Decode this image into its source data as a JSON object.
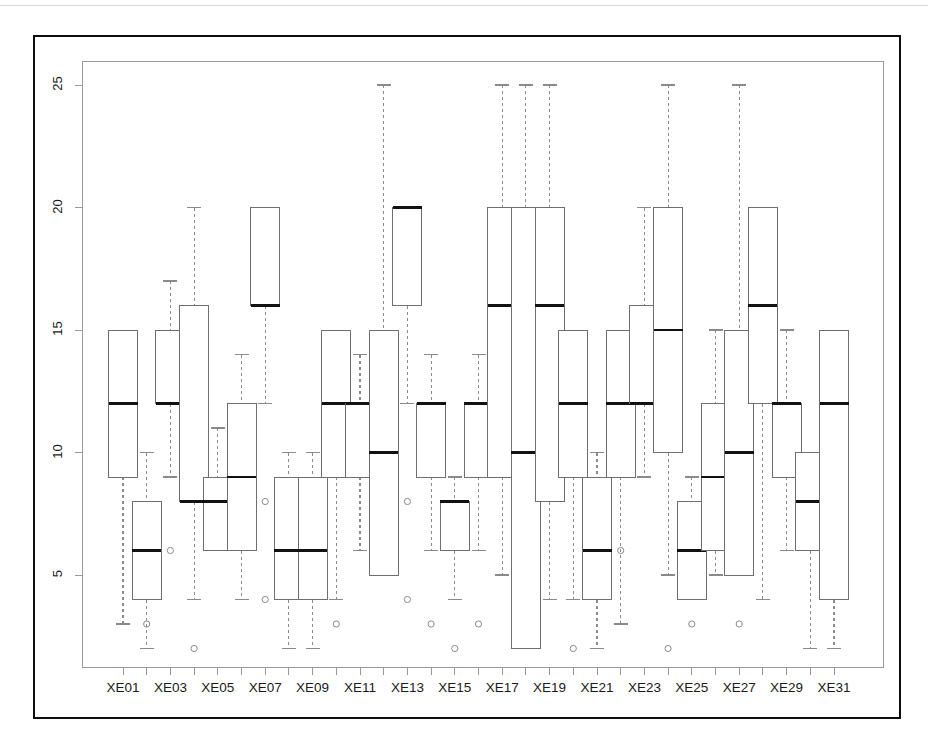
{
  "chart_data": {
    "type": "box",
    "title": "",
    "xlabel": "",
    "ylabel": "",
    "ylim": [
      1.2,
      26.0
    ],
    "y_ticks": [
      5,
      10,
      15,
      20,
      25
    ],
    "y_tick_labels": [
      "5",
      "10",
      "15",
      "20",
      "25"
    ],
    "grid": false,
    "legend": null,
    "categories": [
      "XE01",
      "XE02",
      "XE03",
      "XE04",
      "XE05",
      "XE06",
      "XE07",
      "XE08",
      "XE09",
      "XE10",
      "XE11",
      "XE12",
      "XE13",
      "XE14",
      "XE15",
      "XE16",
      "XE17",
      "XE18",
      "XE19",
      "XE20",
      "XE21",
      "XE22",
      "XE23",
      "XE24",
      "XE25",
      "XE26",
      "XE27",
      "XE28",
      "XE29",
      "XE30",
      "XE31"
    ],
    "x_tick_labels_shown": [
      "XE01",
      "XE03",
      "XE05",
      "XE07",
      "XE09",
      "XE11",
      "XE13",
      "XE15",
      "XE17",
      "XE19",
      "XE21",
      "XE23",
      "XE25",
      "XE27",
      "XE29",
      "XE31"
    ],
    "boxes": [
      {
        "label": "XE01",
        "whisker_low": 3,
        "q1": 9,
        "median": 12,
        "q3": 15,
        "whisker_high": 15,
        "outliers": []
      },
      {
        "label": "XE02",
        "whisker_low": 2,
        "q1": 4,
        "median": 6,
        "q3": 8,
        "whisker_high": 10,
        "outliers": [
          3
        ]
      },
      {
        "label": "XE03",
        "whisker_low": 9,
        "q1": 12,
        "median": 12,
        "q3": 15,
        "whisker_high": 17,
        "outliers": [
          6
        ]
      },
      {
        "label": "XE04",
        "whisker_low": 4,
        "q1": 8,
        "median": 8,
        "q3": 16,
        "whisker_high": 20,
        "outliers": [
          2
        ]
      },
      {
        "label": "XE05",
        "whisker_low": 6,
        "q1": 6,
        "median": 8,
        "q3": 9,
        "whisker_high": 11,
        "outliers": []
      },
      {
        "label": "XE06",
        "whisker_low": 4,
        "q1": 6,
        "median": 9,
        "q3": 12,
        "whisker_high": 14,
        "outliers": []
      },
      {
        "label": "XE07",
        "whisker_low": 12,
        "q1": 16,
        "median": 16,
        "q3": 20,
        "whisker_high": 20,
        "outliers": [
          8,
          4
        ]
      },
      {
        "label": "XE08",
        "whisker_low": 2,
        "q1": 4,
        "median": 6,
        "q3": 9,
        "whisker_high": 10,
        "outliers": []
      },
      {
        "label": "XE09",
        "whisker_low": 2,
        "q1": 4,
        "median": 6,
        "q3": 9,
        "whisker_high": 10,
        "outliers": []
      },
      {
        "label": "XE10",
        "whisker_low": 4,
        "q1": 9,
        "median": 12,
        "q3": 15,
        "whisker_high": 15,
        "outliers": [
          3
        ]
      },
      {
        "label": "XE11",
        "whisker_low": 6,
        "q1": 9,
        "median": 12,
        "q3": 12,
        "whisker_high": 14,
        "outliers": []
      },
      {
        "label": "XE12",
        "whisker_low": 5,
        "q1": 5,
        "median": 10,
        "q3": 15,
        "whisker_high": 25,
        "outliers": []
      },
      {
        "label": "XE13",
        "whisker_low": 12,
        "q1": 16,
        "median": 20,
        "q3": 20,
        "whisker_high": 20,
        "outliers": [
          8,
          4
        ]
      },
      {
        "label": "XE14",
        "whisker_low": 6,
        "q1": 9,
        "median": 12,
        "q3": 12,
        "whisker_high": 14,
        "outliers": [
          3
        ]
      },
      {
        "label": "XE15",
        "whisker_low": 4,
        "q1": 6,
        "median": 8,
        "q3": 8,
        "whisker_high": 9,
        "outliers": [
          2
        ]
      },
      {
        "label": "XE16",
        "whisker_low": 6,
        "q1": 9,
        "median": 12,
        "q3": 12,
        "whisker_high": 14,
        "outliers": [
          3
        ]
      },
      {
        "label": "XE17",
        "whisker_low": 5,
        "q1": 9,
        "median": 16,
        "q3": 20,
        "whisker_high": 25,
        "outliers": []
      },
      {
        "label": "XE18",
        "whisker_low": 2,
        "q1": 2,
        "median": 10,
        "q3": 20,
        "whisker_high": 25,
        "outliers": []
      },
      {
        "label": "XE19",
        "whisker_low": 4,
        "q1": 8,
        "median": 16,
        "q3": 20,
        "whisker_high": 25,
        "outliers": []
      },
      {
        "label": "XE20",
        "whisker_low": 4,
        "q1": 9,
        "median": 12,
        "q3": 15,
        "whisker_high": 15,
        "outliers": [
          2
        ]
      },
      {
        "label": "XE21",
        "whisker_low": 2,
        "q1": 4,
        "median": 6,
        "q3": 9,
        "whisker_high": 10,
        "outliers": []
      },
      {
        "label": "XE22",
        "whisker_low": 3,
        "q1": 9,
        "median": 12,
        "q3": 15,
        "whisker_high": 15,
        "outliers": [
          6
        ]
      },
      {
        "label": "XE23",
        "whisker_low": 9,
        "q1": 12,
        "median": 12,
        "q3": 16,
        "whisker_high": 20,
        "outliers": []
      },
      {
        "label": "XE24",
        "whisker_low": 5,
        "q1": 10,
        "median": 15,
        "q3": 20,
        "whisker_high": 25,
        "outliers": [
          2
        ]
      },
      {
        "label": "XE25",
        "whisker_low": 4,
        "q1": 4,
        "median": 6,
        "q3": 8,
        "whisker_high": 9,
        "outliers": [
          3
        ]
      },
      {
        "label": "XE26",
        "whisker_low": 5,
        "q1": 6,
        "median": 9,
        "q3": 12,
        "whisker_high": 15,
        "outliers": []
      },
      {
        "label": "XE27",
        "whisker_low": 5,
        "q1": 5,
        "median": 10,
        "q3": 15,
        "whisker_high": 25,
        "outliers": [
          3
        ]
      },
      {
        "label": "XE28",
        "whisker_low": 4,
        "q1": 12,
        "median": 16,
        "q3": 20,
        "whisker_high": 20,
        "outliers": []
      },
      {
        "label": "XE29",
        "whisker_low": 6,
        "q1": 9,
        "median": 12,
        "q3": 12,
        "whisker_high": 15,
        "outliers": []
      },
      {
        "label": "XE30",
        "whisker_low": 2,
        "q1": 6,
        "median": 8,
        "q3": 10,
        "whisker_high": 10,
        "outliers": []
      },
      {
        "label": "XE31",
        "whisker_low": 2,
        "q1": 4,
        "median": 12,
        "q3": 15,
        "whisker_high": 15,
        "outliers": []
      }
    ],
    "style": {
      "box_line_color": "#6f6f6f",
      "median_line_color": "#111111",
      "whisker_color": "#8a8a8a",
      "whisker_dash": "dashed",
      "outlier_marker": "open-circle",
      "outlier_color": "#8a8a8a",
      "background": "#ffffff",
      "frame_color": "#0d0d0d"
    }
  }
}
